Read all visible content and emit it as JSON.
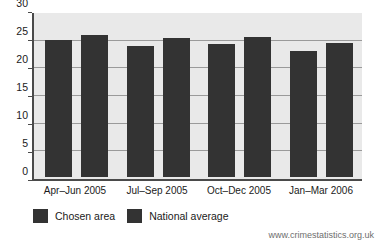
{
  "chart_data": {
    "type": "bar",
    "title": "",
    "subtitle": "",
    "xlabel": "",
    "ylabel": "",
    "ylim": [
      0,
      30
    ],
    "yticks": [
      0,
      5,
      10,
      15,
      20,
      25,
      30
    ],
    "grid": true,
    "legend_position": "bottom-left",
    "categories": [
      "Apr–Jun 2005",
      "Jul–Sep 2005",
      "Oct–Dec 2005",
      "Jan–Mar 2006"
    ],
    "series": [
      {
        "name": "Chosen area",
        "color": "#333333",
        "values": [
          25,
          24,
          24.3,
          23
        ]
      },
      {
        "name": "National average",
        "color": "#333333",
        "values": [
          26,
          25.5,
          25.6,
          24.5
        ]
      }
    ]
  },
  "legend": {
    "items": [
      {
        "label": "Chosen area"
      },
      {
        "label": "National average"
      }
    ]
  },
  "footer": {
    "source_url": "www.crimestatistics.org.uk"
  },
  "colors": {
    "bar": "#333333",
    "plot_background": "#e9e9e9",
    "gridline": "#9a9a9a",
    "axis": "#4a4a4a",
    "page_background": "#ffffff",
    "text": "#1a1a1a",
    "footer_text": "#6e6e6e"
  }
}
